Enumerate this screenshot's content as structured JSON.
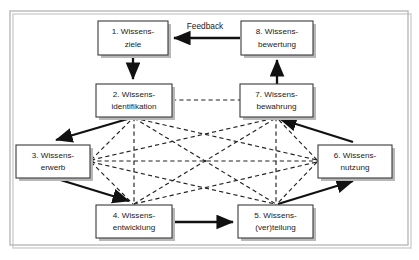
{
  "diagram": {
    "frame": {
      "x": 10,
      "y": 11,
      "width": 398,
      "height": 234
    },
    "colors": {
      "background": "#ffffff",
      "box_fill": "#ffffff",
      "box_stroke": "#3a3a3a",
      "frame_stroke": "#b9b9b9",
      "solid_arrow": "#111111",
      "dashed_arrow": "#222222",
      "text": "#1a1a1a",
      "shadow": "#b8b8b8"
    },
    "nodes": [
      {
        "id": "n1",
        "number": "1.",
        "line1": "1. Wissens-",
        "line2": "ziele",
        "x": 98,
        "y": 21,
        "w": 70,
        "h": 34
      },
      {
        "id": "n2",
        "number": "2.",
        "line1": "2. Wissens-",
        "line2": "identifikation",
        "x": 96,
        "y": 84,
        "w": 76,
        "h": 33
      },
      {
        "id": "n3",
        "number": "3.",
        "line1": "3. Wissens-",
        "line2": "erwerb",
        "x": 16,
        "y": 145,
        "w": 74,
        "h": 33
      },
      {
        "id": "n4",
        "number": "4.",
        "line1": "4. Wissens-",
        "line2": "entwicklung",
        "x": 96,
        "y": 205,
        "w": 76,
        "h": 33
      },
      {
        "id": "n5",
        "number": "5.",
        "line1": "5. Wissens-",
        "line2": "(ver)teilung",
        "x": 238,
        "y": 205,
        "w": 75,
        "h": 33
      },
      {
        "id": "n6",
        "number": "6.",
        "line1": "6. Wissens-",
        "line2": "nutzung",
        "x": 318,
        "y": 145,
        "w": 74,
        "h": 33
      },
      {
        "id": "n7",
        "number": "7.",
        "line1": "7. Wissens-",
        "line2": "bewahrung",
        "x": 240,
        "y": 84,
        "w": 73,
        "h": 33
      },
      {
        "id": "n8",
        "number": "8.",
        "line1": "8. Wissens-",
        "line2": "bewertung",
        "x": 241,
        "y": 21,
        "w": 72,
        "h": 34
      }
    ],
    "edge_labels": [
      {
        "id": "feedback",
        "text": "Feedback",
        "x": 205,
        "y": 27
      }
    ],
    "solid_edges": [
      {
        "from": "n8",
        "to": "n1",
        "label": "Feedback"
      },
      {
        "from": "n1",
        "to": "n2",
        "label": ""
      },
      {
        "from": "n2",
        "to": "n3",
        "label": ""
      },
      {
        "from": "n3",
        "to": "n4",
        "label": ""
      },
      {
        "from": "n4",
        "to": "n5",
        "label": ""
      },
      {
        "from": "n5",
        "to": "n6",
        "label": ""
      },
      {
        "from": "n6",
        "to": "n7",
        "label": ""
      },
      {
        "from": "n7",
        "to": "n8",
        "label": ""
      }
    ],
    "dashed_edges": [
      {
        "from": "n2",
        "to": "n7"
      },
      {
        "from": "n2",
        "to": "n4"
      },
      {
        "from": "n7",
        "to": "n5"
      },
      {
        "from": "n3",
        "to": "n6"
      },
      {
        "from": "n2",
        "to": "n5"
      },
      {
        "from": "n2",
        "to": "n6"
      },
      {
        "from": "n3",
        "to": "n7"
      },
      {
        "from": "n3",
        "to": "n5"
      },
      {
        "from": "n4",
        "to": "n7"
      },
      {
        "from": "n4",
        "to": "n6"
      },
      {
        "from": "n4",
        "to": "n5"
      },
      {
        "from": "n3",
        "to": "n4"
      }
    ]
  }
}
